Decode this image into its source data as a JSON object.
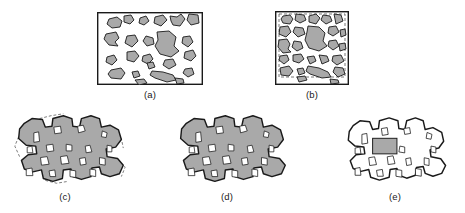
{
  "figure": {
    "background_color": "#ffffff",
    "stroke_color": "#1a1a1a",
    "particle_fill": "#a9a9a9",
    "inclusion_fill": "#ffffff",
    "dashed_color": "#555555",
    "caption_color": "#1a1a1a"
  },
  "panels": [
    {
      "id": "panel-a",
      "caption": "(a)",
      "kind": "rect-field",
      "description": "Rectangular field containing scattered gray angular particles",
      "box": {
        "x": 97,
        "y": 12,
        "width": 106,
        "height": 73
      },
      "caption_pos": {
        "x": 127,
        "y": 89,
        "width": 46
      },
      "border_width": 1.4,
      "has_dashed_inner": false,
      "particles": [
        "M 12,7 L 20,5 L 25,9 L 23,15 L 15,16 L 10,12 Z",
        "M 27,4 L 34,3 L 37,8 L 33,12 L 27,10 Z",
        "M 43,6 L 49,4 L 52,9 L 47,13 L 42,11 Z",
        "M 58,5 L 66,3 L 70,8 L 64,14 L 57,11 Z",
        "M 73,4 L 80,5 L 84,2 L 88,7 L 83,14 L 76,13 L 74,9 Z",
        "M 92,2 L 101,3 L 102,11 L 94,13 L 90,8 Z",
        "M 9,22 L 19,20 L 22,26 L 18,30 L 21,34 L 12,33 L 7,27 Z",
        "M 30,24 L 38,23 L 41,29 L 35,35 L 28,31 Z",
        "M 49,24 L 56,26 L 57,32 L 50,34 L 46,29 Z",
        "M 60,20 L 72,19 L 79,25 L 77,34 L 82,39 L 74,45 L 63,42 L 58,34 L 61,28 Z",
        "M 86,25 L 93,24 L 96,30 L 91,35 L 85,31 Z",
        "M 88,40 L 96,38 L 99,44 L 94,49 L 87,46 Z",
        "M 10,45 L 17,43 L 20,48 L 15,53 L 9,50 Z",
        "M 30,40 L 38,39 L 42,44 L 37,50 L 30,48 Z",
        "M 46,44 L 53,42 L 56,47 L 51,52 L 45,49 Z",
        "M 50,51 L 56,50 L 58,55 L 52,57 Z",
        "M 68,48 L 76,47 L 79,53 L 72,57 L 66,53 Z",
        "M 14,58 L 24,56 L 28,61 L 24,67 L 14,66 L 11,62 Z",
        "M 35,60 L 41,59 L 43,64 L 37,66 Z",
        "M 55,59 L 66,60 L 76,63 L 79,68 L 70,70 L 58,66 L 53,63 Z",
        "M 88,57 L 95,56 L 97,62 L 91,65 L 86,61 Z",
        "M 38,68 L 47,67 L 50,71 L 42,73 Z",
        "M 78,66 L 86,67 L 87,71 L 80,72 Z"
      ]
    },
    {
      "id": "panel-b",
      "caption": "(b)",
      "kind": "rect-field",
      "description": "Rectangular field with dashed inner boundary and enlarged gray particles",
      "box": {
        "x": 275,
        "y": 11,
        "width": 74,
        "height": 74
      },
      "caption_pos": {
        "x": 289,
        "y": 89,
        "width": 46
      },
      "border_width": 1.4,
      "has_dashed_inner": true,
      "dashed_inset": {
        "x": 4,
        "y": 3,
        "width": 66,
        "height": 63
      },
      "particles": [
        "M 8,5 L 15,4 L 18,8 L 15,13 L 8,12 L 6,8 Z",
        "M 21,3 L 29,4 L 31,9 L 25,12 L 20,9 Z",
        "M 34,5 L 41,3 L 45,7 L 41,13 L 34,11 Z",
        "M 48,4 L 55,5 L 57,10 L 51,13 L 46,9 Z",
        "M 59,3 L 66,4 L 68,10 L 61,13 Z",
        "M 5,16 L 13,15 L 16,21 L 11,26 L 4,23 Z",
        "M 20,16 L 28,17 L 30,23 L 23,26 L 18,21 Z",
        "M 33,15 L 44,16 L 50,22 L 48,30 L 52,35 L 44,40 L 34,37 L 30,29 L 32,21 Z",
        "M 54,16 L 61,15 L 64,21 L 58,25 L 53,22 Z",
        "M 65,19 L 70,18 L 71,24 L 66,26 Z",
        "M 4,29 L 12,28 L 15,33 L 13,38 L 16,41 L 8,42 L 3,36 Z",
        "M 19,30 L 26,31 L 28,37 L 22,40 L 17,36 Z",
        "M 54,30 L 61,29 L 64,35 L 58,39 L 53,35 Z",
        "M 64,33 L 70,32 L 71,38 L 65,40 Z",
        "M 5,45 L 12,44 L 14,49 L 9,53 L 4,49 Z",
        "M 18,44 L 26,43 L 29,48 L 24,52 L 18,50 Z",
        "M 32,46 L 39,45 L 41,50 L 35,53 Z",
        "M 44,44 L 52,45 L 54,50 L 47,53 Z",
        "M 58,45 L 66,44 L 69,50 L 62,54 L 57,50 Z",
        "M 5,57 L 14,55 L 18,60 L 14,65 L 6,64 Z",
        "M 22,58 L 28,57 L 30,62 L 24,64 Z",
        "M 33,55 L 44,57 L 53,61 L 56,66 L 47,67 L 35,63 L 31,60 Z",
        "M 60,56 L 68,57 L 70,63 L 63,66 L 58,61 Z",
        "M 22,66 L 30,65 L 32,69 L 24,71 Z",
        "M 55,68 L 63,69 L 64,72 L 56,73 Z"
      ]
    },
    {
      "id": "panel-c",
      "caption": "(c)",
      "kind": "blob",
      "description": "Irregular notched blob, gray filled, white angular inclusions, partial dashed original outline",
      "box": {
        "x": 10,
        "y": 110,
        "width": 120,
        "height": 78
      },
      "caption_pos": {
        "x": 42,
        "y": 191,
        "width": 46
      },
      "fill": "#a9a9a9",
      "has_dashed_ghost": true,
      "has_gray_rect": false,
      "inclusions": [
        "M 24,24 L 29,23 L 30,33 L 24,34 Z",
        "M 45,18 L 52,17 L 53,24 L 46,25 Z",
        "M 70,17 L 76,16 L 78,22 L 71,24 Z",
        "M 96,22 L 101,24 L 100,29 L 95,28 Z",
        "M 17,39 L 22,38 L 23,45 L 17,45 Z",
        "M 37,37 L 44,36 L 45,43 L 38,44 Z",
        "M 58,36 L 64,37 L 64,43 L 58,43 Z",
        "M 78,38 L 83,37 L 85,44 L 79,45 Z",
        "M 101,37 L 106,38 L 106,44 L 101,44 Z",
        "M 31,50 L 38,49 L 40,57 L 32,58 Z",
        "M 52,49 L 59,48 L 61,56 L 53,57 Z",
        "M 72,51 L 78,50 L 79,57 L 73,58 Z",
        "M 93,50 L 99,51 L 99,58 L 93,57 Z",
        "M 16,62 L 22,61 L 23,69 L 16,69 Z",
        "M 40,64 L 46,63 L 47,70 L 41,70 Z",
        "M 62,63 L 68,64 L 68,71 L 62,70 Z",
        "M 83,62 L 89,63 L 89,70 L 83,69 Z"
      ]
    },
    {
      "id": "panel-d",
      "caption": "(d)",
      "kind": "blob",
      "description": "Same irregular notched blob, gray filled with white inclusions, no ghost outline",
      "box": {
        "x": 172,
        "y": 110,
        "width": 120,
        "height": 78
      },
      "caption_pos": {
        "x": 204,
        "y": 191,
        "width": 46
      },
      "fill": "#a9a9a9",
      "has_dashed_ghost": false,
      "has_gray_rect": false,
      "inclusions": [
        "M 24,24 L 29,23 L 30,33 L 24,34 Z",
        "M 45,18 L 52,17 L 53,24 L 46,25 Z",
        "M 70,17 L 76,16 L 78,22 L 71,24 Z",
        "M 96,22 L 101,24 L 100,29 L 95,28 Z",
        "M 17,39 L 22,38 L 23,45 L 17,45 Z",
        "M 37,37 L 44,36 L 45,43 L 38,44 Z",
        "M 58,36 L 64,37 L 64,43 L 58,43 Z",
        "M 78,38 L 83,37 L 85,44 L 79,45 Z",
        "M 101,37 L 106,38 L 106,44 L 101,44 Z",
        "M 31,50 L 38,49 L 40,57 L 32,58 Z",
        "M 52,49 L 59,48 L 61,56 L 53,57 Z",
        "M 72,51 L 78,50 L 79,57 L 73,58 Z",
        "M 93,50 L 99,51 L 99,58 L 93,57 Z",
        "M 16,62 L 22,61 L 23,69 L 16,69 Z",
        "M 40,64 L 46,63 L 47,70 L 41,70 Z",
        "M 62,63 L 68,64 L 68,71 L 62,70 Z",
        "M 83,62 L 89,63 L 89,70 L 83,69 Z"
      ]
    },
    {
      "id": "panel-e",
      "caption": "(e)",
      "kind": "blob",
      "description": "Same blob outline, unfilled white interior, gray inclusions and one solid gray rectangle",
      "box": {
        "x": 340,
        "y": 113,
        "width": 110,
        "height": 72
      },
      "caption_pos": {
        "x": 372,
        "y": 191,
        "width": 46
      },
      "fill": "#ffffff",
      "has_dashed_ghost": false,
      "has_gray_rect": true,
      "gray_rect": {
        "x": 33,
        "y": 26,
        "width": 25,
        "height": 16
      },
      "inclusions": [
        "M 22,22 L 27,21 L 28,31 L 22,32 Z",
        "M 42,16 L 48,15 L 49,22 L 43,23 Z",
        "M 65,16 L 71,15 L 72,21 L 66,22 Z",
        "M 89,20 L 94,22 L 93,27 L 88,26 Z",
        "M 15,36 L 20,35 L 21,42 L 15,42 Z",
        "M 61,34 L 66,35 L 66,41 L 60,40 Z",
        "M 93,34 L 98,35 L 98,41 L 93,40 Z",
        "M 29,46 L 35,45 L 37,53 L 30,54 Z",
        "M 48,45 L 54,44 L 56,52 L 49,53 Z",
        "M 67,47 L 72,46 L 73,53 L 68,54 Z",
        "M 86,46 L 91,47 L 91,54 L 86,53 Z",
        "M 15,57 L 20,56 L 21,64 L 15,64 Z",
        "M 37,59 L 43,58 L 44,65 L 38,65 Z",
        "M 57,58 L 63,59 L 63,66 L 57,65 Z",
        "M 77,57 L 83,58 L 83,65 L 77,64 Z"
      ]
    }
  ],
  "blob_outline_path": "M 14,14 L 22,9 L 33,10 L 36,18 L 43,17 L 44,9 L 55,6 L 64,9 L 65,17 L 72,18 L 74,9 L 84,6 L 93,9 L 95,18 L 104,16 L 113,21 L 116,31 L 110,39 L 100,41 L 101,49 L 112,51 L 118,58 L 114,67 L 104,70 L 95,67 L 93,60 L 85,61 L 84,70 L 74,73 L 65,70 L 63,62 L 55,63 L 54,72 L 44,75 L 34,72 L 32,63 L 23,65 L 14,62 L 11,53 L 18,47 L 27,46 L 26,38 L 16,37 L 8,30 L 9,20 Z",
  "blob_outline_e_path": "M 13,13 L 20,8 L 30,9 L 33,17 L 39,16 L 40,8 L 50,5 L 59,8 L 60,16 L 66,17 L 68,8 L 77,5 L 85,8 L 87,17 L 95,15 L 104,20 L 106,29 L 101,36 L 92,38 L 93,45 L 103,47 L 108,54 L 104,62 L 95,65 L 87,62 L 85,55 L 78,56 L 77,64 L 68,67 L 60,64 L 58,57 L 51,58 L 50,66 L 40,69 L 31,66 L 29,58 L 21,60 L 13,57 L 10,49 L 16,43 L 25,42 L 24,35 L 15,34 L 8,28 L 9,19 Z",
  "ghost_dashed_segments": [
    "M 30,9 L 42,6 L 55,4",
    "M 8,28 L 4,38 L 9,49",
    "M 108,22 L 116,30 L 118,40",
    "M 112,52 L 120,60 L 116,70",
    "M 36,74 L 48,77 L 60,75"
  ]
}
